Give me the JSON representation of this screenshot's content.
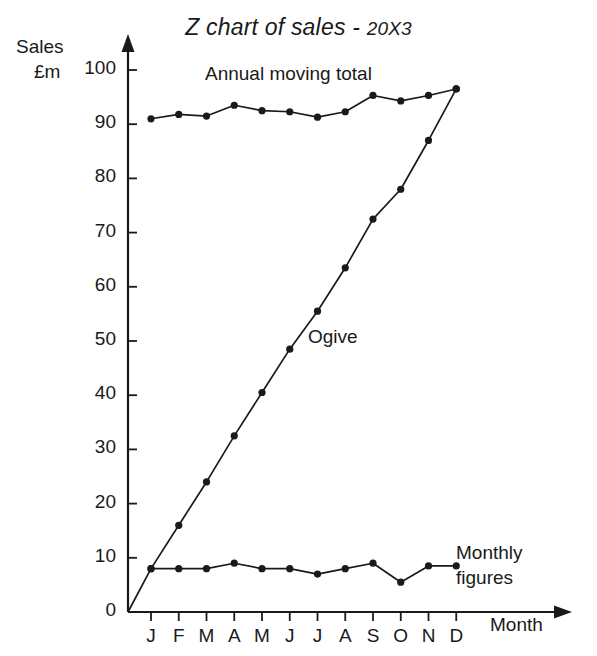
{
  "chart_data": {
    "type": "line",
    "title": "Z chart of sales - 20X3",
    "title_main": "Z chart of sales - ",
    "title_year": "20X3",
    "xlabel": "Month",
    "ylabel": "Sales £m",
    "ylabel_line1": "Sales",
    "ylabel_line2": "£m",
    "categories": [
      "J",
      "F",
      "M",
      "A",
      "M",
      "J",
      "J",
      "A",
      "S",
      "O",
      "N",
      "D"
    ],
    "month_names": [
      "January",
      "February",
      "March",
      "April",
      "May",
      "June",
      "July",
      "August",
      "September",
      "October",
      "November",
      "December"
    ],
    "ylim": [
      0,
      100
    ],
    "xlim": [
      0,
      13
    ],
    "yticks": [
      0,
      10,
      20,
      30,
      40,
      50,
      60,
      70,
      80,
      90,
      100
    ],
    "ytick_labels": [
      "0",
      "10",
      "20",
      "30",
      "40",
      "50",
      "60",
      "70",
      "80",
      "90",
      "100"
    ],
    "grid": false,
    "legend": "inline-annotations",
    "series": [
      {
        "name": "Annual moving total",
        "label_text": "Annual moving total",
        "values": [
          91,
          91.8,
          91.5,
          93.5,
          92.5,
          92.3,
          91.3,
          92.3,
          95.3,
          94.3,
          95.3,
          96.5
        ],
        "marker": "filled-circle",
        "color": "#1a1a1a"
      },
      {
        "name": "Ogive",
        "label_text": "Ogive",
        "values": [
          8,
          16,
          24,
          32.5,
          40.5,
          48.5,
          55.5,
          63.5,
          72.5,
          78,
          87,
          96.5
        ],
        "marker": "filled-circle",
        "color": "#1a1a1a",
        "starts_at_origin": true
      },
      {
        "name": "Monthly figures",
        "label_text": "Monthly figures",
        "label_line1": "Monthly",
        "label_line2": "figures",
        "values": [
          8,
          8,
          8,
          9,
          8,
          8,
          7,
          8,
          9,
          5.5,
          8.5,
          8.5
        ],
        "marker": "filled-circle",
        "color": "#1a1a1a"
      }
    ],
    "colors": {
      "ink": "#1a1a1a",
      "background": "#ffffff"
    }
  }
}
